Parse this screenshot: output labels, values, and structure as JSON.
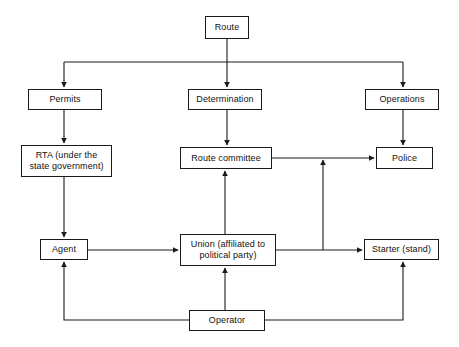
{
  "diagram": {
    "canvas": {
      "width": 459,
      "height": 347,
      "background": "#ffffff"
    },
    "style": {
      "stroke": "#1a1a1a",
      "box_fill": "#ffffff",
      "text_color": "#111111"
    },
    "nodes": [
      {
        "id": "route",
        "label": "Route",
        "x": 205,
        "y": 16,
        "w": 44,
        "h": 23
      },
      {
        "id": "permits",
        "label": "Permits",
        "x": 28,
        "y": 89,
        "w": 74,
        "h": 21
      },
      {
        "id": "determination",
        "label": "Determination",
        "x": 188,
        "y": 89,
        "w": 74,
        "h": 21
      },
      {
        "id": "operations",
        "label": "Operations",
        "x": 365,
        "y": 89,
        "w": 74,
        "h": 21
      },
      {
        "id": "rta",
        "label": "RTA (under the\nstate government)",
        "x": 21,
        "y": 145,
        "w": 91,
        "h": 32
      },
      {
        "id": "route-committee",
        "label": "Route committee",
        "x": 180,
        "y": 147,
        "w": 92,
        "h": 22
      },
      {
        "id": "police",
        "label": "Police",
        "x": 376,
        "y": 147,
        "w": 57,
        "h": 22
      },
      {
        "id": "agent",
        "label": "Agent",
        "x": 40,
        "y": 239,
        "w": 48,
        "h": 21
      },
      {
        "id": "union",
        "label": "Union (affiliated to\npolitical party)",
        "x": 180,
        "y": 234,
        "w": 96,
        "h": 32
      },
      {
        "id": "starter",
        "label": "Starter (stand)",
        "x": 364,
        "y": 239,
        "w": 75,
        "h": 21
      },
      {
        "id": "operator",
        "label": "Operator",
        "x": 189,
        "y": 310,
        "w": 76,
        "h": 21
      }
    ],
    "edges": [
      {
        "id": "route-to-permits",
        "from": "route",
        "to": "permits",
        "arrow": "down"
      },
      {
        "id": "route-to-determination",
        "from": "route",
        "to": "determination",
        "arrow": "down"
      },
      {
        "id": "route-to-operations",
        "from": "route",
        "to": "operations",
        "arrow": "down"
      },
      {
        "id": "permits-to-rta",
        "from": "permits",
        "to": "rta",
        "arrow": "down"
      },
      {
        "id": "determination-to-committee",
        "from": "determination",
        "to": "route-committee",
        "arrow": "down"
      },
      {
        "id": "operations-to-police",
        "from": "operations",
        "to": "police",
        "arrow": "down"
      },
      {
        "id": "rta-to-agent",
        "from": "rta",
        "to": "agent",
        "arrow": "down"
      },
      {
        "id": "committee-to-police",
        "from": "route-committee",
        "to": "police",
        "arrow": "right"
      },
      {
        "id": "agent-to-union",
        "from": "agent",
        "to": "union",
        "arrow": "right"
      },
      {
        "id": "union-to-starter",
        "from": "union",
        "to": "starter",
        "arrow": "right"
      },
      {
        "id": "union-to-committee",
        "from": "union",
        "to": "route-committee",
        "arrow": "up"
      },
      {
        "id": "starterline-to-police",
        "from": "union-starter-link",
        "to": "committee-police-link",
        "arrow": "up"
      },
      {
        "id": "operator-to-union",
        "from": "operator",
        "to": "union",
        "arrow": "up"
      },
      {
        "id": "operator-to-agent",
        "from": "operator",
        "to": "agent",
        "arrow": "up"
      },
      {
        "id": "operator-to-starter",
        "from": "operator",
        "to": "starter",
        "arrow": "up"
      }
    ]
  }
}
